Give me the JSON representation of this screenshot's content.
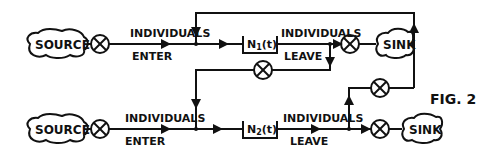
{
  "figure": {
    "label": "FIG. 2",
    "rows": [
      {
        "source": "SOURCE",
        "enter_top": "INDIVIDUALS",
        "enter_bottom": "ENTER",
        "box_label": "N",
        "box_subscript": "1",
        "box_arg": "(t)",
        "leave_top": "INDIVIDUALS",
        "leave_bottom": "LEAVE",
        "sink": "SINK"
      },
      {
        "source": "SOURCE",
        "enter_top": "INDIVIDUALS",
        "enter_bottom": "ENTER",
        "box_label": "N",
        "box_subscript": "2",
        "box_arg": "(t)",
        "leave_top": "INDIVIDUALS",
        "leave_bottom": "LEAVE",
        "sink": "SINK"
      }
    ]
  }
}
